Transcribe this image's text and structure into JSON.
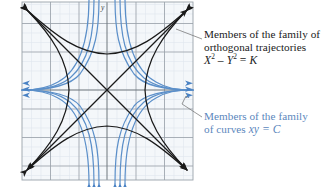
{
  "figure": {
    "kind": "orthogonal-trajectories-diagram",
    "background": "#ffffff",
    "plot": {
      "x": 22,
      "y": 2,
      "width": 171,
      "height": 178,
      "face_color": "#f4f7fa",
      "minor_grid_color": "#dfe6ee",
      "major_grid_color": "#9aa2aa",
      "border_color": "#9aa2aa",
      "minor_step_px": 9.5,
      "major_step_px": 28.5,
      "origin_x": 107,
      "origin_y": 90
    },
    "axis_labels": {
      "x": "x",
      "y": "y",
      "color": "#3a3a3a"
    },
    "families": {
      "orthogonal": {
        "name": "hyperbolas X^2 - Y^2 = K",
        "color": "#1a1a1a",
        "line_width": 1.25,
        "constants": [
          0.0,
          0.42,
          1.15,
          2.3
        ]
      },
      "curves": {
        "name": "hyperbolas xy = C",
        "color": "#5b8fc9",
        "line_width": 1.2,
        "constants": [
          0.16,
          0.55,
          1.3
        ]
      }
    },
    "leader_line_color": "#6b6b6b"
  },
  "annotations": {
    "orthogonal": {
      "line1": "Members of the family of",
      "line2": "orthogonal trajectories",
      "equation_lhs": "X",
      "equation_sup1": "2",
      "equation_minus": " – ",
      "equation_rhs": "Y",
      "equation_sup2": "2",
      "equation_eq": " = ",
      "equation_const": "K",
      "color": "#1a1a1a"
    },
    "curves": {
      "line1": "Members of the family",
      "line2_prefix": "of curves ",
      "line2_eq": "xy = C",
      "color": "#5b87bd"
    }
  }
}
